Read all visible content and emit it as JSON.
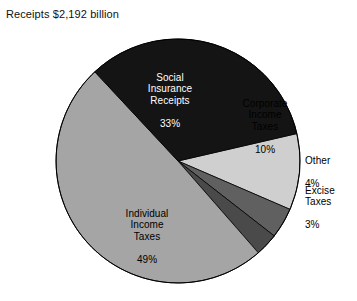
{
  "caption": "Receipts $2,192 billion",
  "chart_data": {
    "type": "pie",
    "title": "Receipts $2,192 billion",
    "total_label": "$2,192 billion",
    "total_value": 2192,
    "units": "billions of dollars",
    "value_suffix": "%",
    "legend": "none",
    "labels_inside_slices": true,
    "start_angle_deg": -13,
    "direction": "clockwise",
    "categories": [
      "Social Insurance Receipts",
      "Corporate Income Taxes",
      "Other",
      "Excise Taxes",
      "Individual Income Taxes"
    ],
    "values": [
      33,
      10,
      4,
      3,
      49
    ],
    "slices": [
      {
        "key": "corporate",
        "name": "Corporate Income Taxes",
        "label_lines": "Corporate\nIncome\nTaxes",
        "value": 10,
        "value_text": "10%",
        "color": "#cfcfcf",
        "label_color": "dark",
        "label_placement": "inside"
      },
      {
        "key": "other",
        "name": "Other",
        "label_lines": "Other",
        "value": 4,
        "value_text": "4%",
        "color": "#606060",
        "label_color": "dark",
        "label_placement": "outside"
      },
      {
        "key": "excise",
        "name": "Excise Taxes",
        "label_lines": "Excise\nTaxes",
        "value": 3,
        "value_text": "3%",
        "color": "#4a4a4a",
        "label_color": "dark",
        "label_placement": "outside"
      },
      {
        "key": "individual",
        "name": "Individual Income Taxes",
        "label_lines": "Individual\nIncome\nTaxes",
        "value": 49,
        "value_text": "49%",
        "color": "#a5a5a5",
        "label_color": "dark",
        "label_placement": "inside"
      },
      {
        "key": "social",
        "name": "Social Insurance Receipts",
        "label_lines": "Social\nInsurance\nReceipts",
        "value": 33,
        "value_text": "33%",
        "color": "#141414",
        "label_color": "light",
        "label_placement": "inside"
      }
    ],
    "geometry": {
      "center_x": 178,
      "center_y": 161,
      "radius": 122
    }
  }
}
